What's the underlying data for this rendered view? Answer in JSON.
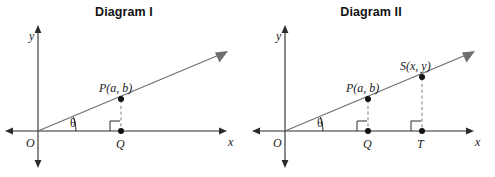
{
  "page": {
    "background_color": "#ffffff",
    "width": 495,
    "height": 177
  },
  "style": {
    "axis_color": "#2b2b2b",
    "ray_color": "#6f6f6f",
    "dash_color": "#8a8a8a",
    "point_color": "#111111",
    "text_color": "#1a1a1a",
    "title_color": "#121212"
  },
  "diagrams": [
    {
      "id": "diagram-1",
      "title": "Diagram I",
      "axes": {
        "x_label": "x",
        "y_label": "y",
        "origin_label": "O"
      },
      "angle": {
        "symbol": "θ",
        "name": "theta"
      },
      "points": [
        {
          "name": "P",
          "label": "P(a, b)",
          "on_ray": true
        },
        {
          "name": "Q",
          "label": "Q",
          "on_axis": true
        }
      ],
      "right_angles": 1,
      "dashed_segments": [
        "P-Q"
      ]
    },
    {
      "id": "diagram-2",
      "title": "Diagram II",
      "axes": {
        "x_label": "x",
        "y_label": "y",
        "origin_label": "O"
      },
      "angle": {
        "symbol": "θ",
        "name": "theta"
      },
      "points": [
        {
          "name": "P",
          "label": "P(a, b)",
          "on_ray": true
        },
        {
          "name": "Q",
          "label": "Q",
          "on_axis": true
        },
        {
          "name": "S",
          "label": "S(x, y)",
          "on_ray": true
        },
        {
          "name": "T",
          "label": "T",
          "on_axis": true
        }
      ],
      "right_angles": 2,
      "dashed_segments": [
        "P-Q",
        "S-T"
      ]
    }
  ]
}
